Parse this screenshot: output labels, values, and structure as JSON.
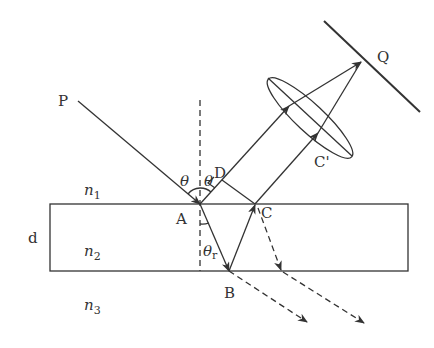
{
  "diagram": {
    "labels": {
      "P": "P",
      "Q": "Q",
      "A": "A",
      "B": "B",
      "C": "C",
      "D": "D",
      "C_prime": "C'",
      "d": "d",
      "theta_incident": "θ",
      "theta_reflected": "θ",
      "theta_r": "θ",
      "theta_r_sub": "r",
      "n1": "n",
      "n1_sub": "1",
      "n2": "n",
      "n2_sub": "2",
      "n3": "n",
      "n3_sub": "3"
    },
    "colors": {
      "stroke": "#333333",
      "background": "#ffffff"
    }
  }
}
